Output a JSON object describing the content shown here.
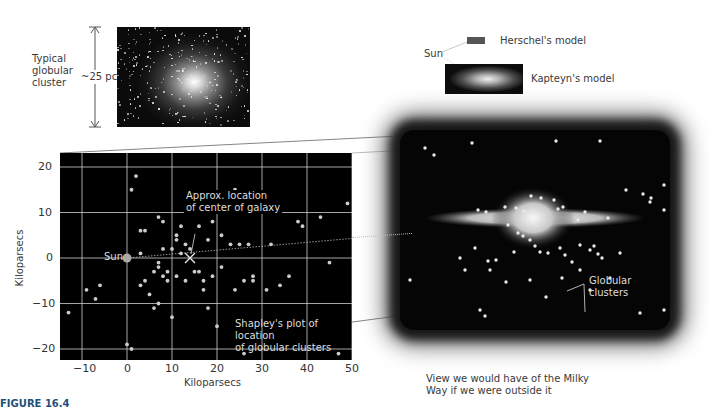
{
  "cluster_photo": {
    "label_lines": [
      "Typical",
      "globular",
      "cluster"
    ],
    "size_label": "~25 pc"
  },
  "models": {
    "sun_label": "Sun",
    "herschel_label": "Herschel's model",
    "kapteyn_label": "Kapteyn's model"
  },
  "plot": {
    "xlabel": "Kiloparsecs",
    "ylabel": "Kiloparsecs",
    "sun_label": "Sun",
    "center_label_lines": [
      "Approx. location",
      "of center of galaxy"
    ],
    "caption_lines": [
      "Shapley's plot of location",
      "of globular clusters"
    ]
  },
  "view": {
    "globular_label": "Globular clusters",
    "caption_lines": [
      "View we would have of the Milky",
      "Way if we were outside it"
    ]
  },
  "figure_label": "FIGURE 16.4",
  "chart_data": {
    "type": "scatter",
    "title": "Shapley's plot of location of globular clusters",
    "xlabel": "Kiloparsecs",
    "ylabel": "Kiloparsecs",
    "xlim": [
      -15,
      50
    ],
    "ylim": [
      -23,
      23
    ],
    "xticks": [
      -10,
      0,
      10,
      20,
      30,
      40,
      50
    ],
    "yticks": [
      -20,
      -10,
      0,
      10,
      20
    ],
    "grid": true,
    "annotations": [
      {
        "text": "Sun",
        "x": 0,
        "y": 0
      },
      {
        "text": "Approx. location of center of galaxy",
        "x": 14,
        "y": 0
      }
    ],
    "series": [
      {
        "name": "Sun",
        "points": [
          [
            0,
            0
          ]
        ]
      },
      {
        "name": "Galactic center",
        "points": [
          [
            14,
            0
          ]
        ]
      },
      {
        "name": "Globular clusters",
        "points": [
          [
            2,
            18
          ],
          [
            1,
            15
          ],
          [
            7,
            9
          ],
          [
            8,
            8
          ],
          [
            12,
            7
          ],
          [
            3,
            6
          ],
          [
            4,
            6
          ],
          [
            11,
            5
          ],
          [
            11,
            4
          ],
          [
            13,
            3
          ],
          [
            3,
            1
          ],
          [
            8,
            2
          ],
          [
            10,
            2
          ],
          [
            12,
            1
          ],
          [
            14,
            2
          ],
          [
            16,
            7
          ],
          [
            18,
            4
          ],
          [
            19,
            8
          ],
          [
            21,
            5
          ],
          [
            22,
            12
          ],
          [
            25,
            3
          ],
          [
            24,
            15
          ],
          [
            27,
            3
          ],
          [
            23,
            3
          ],
          [
            32,
            3
          ],
          [
            38,
            8
          ],
          [
            39,
            7
          ],
          [
            43,
            9
          ],
          [
            49,
            12
          ],
          [
            -9,
            -7
          ],
          [
            -7,
            -9
          ],
          [
            -6,
            -6
          ],
          [
            3,
            -6
          ],
          [
            4,
            -5
          ],
          [
            6,
            -3
          ],
          [
            7,
            -2
          ],
          [
            8,
            -4
          ],
          [
            7,
            -1
          ],
          [
            9,
            -5
          ],
          [
            9,
            -3
          ],
          [
            11,
            -4
          ],
          [
            13,
            -5
          ],
          [
            15,
            -3
          ],
          [
            17,
            -5
          ],
          [
            17,
            -7
          ],
          [
            18,
            -11
          ],
          [
            20,
            -15
          ],
          [
            16,
            -3
          ],
          [
            19,
            -4
          ],
          [
            21,
            -2
          ],
          [
            24,
            -7
          ],
          [
            26,
            -5
          ],
          [
            28,
            -5
          ],
          [
            28,
            -4
          ],
          [
            31,
            -7
          ],
          [
            34,
            -6
          ],
          [
            36,
            -4
          ],
          [
            45,
            -1
          ],
          [
            5,
            -8
          ],
          [
            7,
            -10
          ],
          [
            6,
            -11
          ],
          [
            10,
            -13
          ],
          [
            -13,
            -12
          ],
          [
            0,
            -19
          ],
          [
            1,
            -20
          ],
          [
            26,
            -21
          ],
          [
            47,
            -21
          ]
        ]
      }
    ]
  }
}
